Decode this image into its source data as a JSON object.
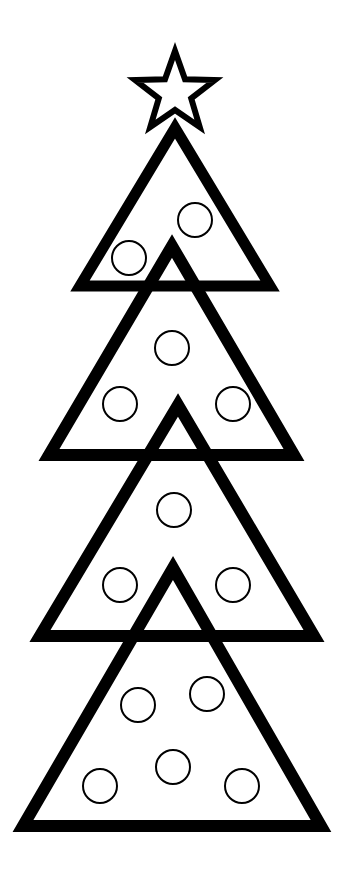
{
  "colors": {
    "background": "#ffffff",
    "stroke": "#000000",
    "fill": "#ffffff"
  },
  "star": {
    "cx": 175,
    "cy": 93,
    "outer_r": 42,
    "inner_r": 17,
    "stroke_width": 6
  },
  "tiers": [
    {
      "points": "175,128 80,286 270,286",
      "stroke_width": 11,
      "ornaments": [
        {
          "cx": 195,
          "cy": 220,
          "r": 17
        },
        {
          "cx": 129,
          "cy": 258,
          "r": 17
        }
      ]
    },
    {
      "points": "172,246 49,455 294,455",
      "stroke_width": 12,
      "ornaments": [
        {
          "cx": 172,
          "cy": 348,
          "r": 17
        },
        {
          "cx": 120,
          "cy": 404,
          "r": 17
        },
        {
          "cx": 233,
          "cy": 404,
          "r": 17
        }
      ]
    },
    {
      "points": "178,405 40,636 314,636",
      "stroke_width": 12,
      "ornaments": [
        {
          "cx": 174,
          "cy": 510,
          "r": 17
        },
        {
          "cx": 120,
          "cy": 585,
          "r": 17
        },
        {
          "cx": 233,
          "cy": 585,
          "r": 17
        }
      ]
    },
    {
      "points": "173,568 23,826 321,826",
      "stroke_width": 12,
      "ornaments": [
        {
          "cx": 138,
          "cy": 705,
          "r": 17
        },
        {
          "cx": 207,
          "cy": 694,
          "r": 17
        },
        {
          "cx": 100,
          "cy": 786,
          "r": 17
        },
        {
          "cx": 173,
          "cy": 767,
          "r": 17
        },
        {
          "cx": 242,
          "cy": 786,
          "r": 17
        }
      ]
    }
  ]
}
